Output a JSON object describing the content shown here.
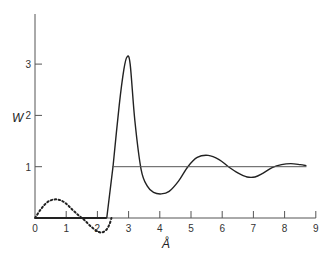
{
  "chart_data": {
    "type": "line",
    "title": "",
    "xlabel": "Å",
    "ylabel": "W",
    "xlim": [
      0,
      9
    ],
    "ylim": [
      0,
      3.8
    ],
    "grid": false,
    "legend": null,
    "x_ticks": [
      "0",
      "1",
      "2",
      "3",
      "4",
      "5",
      "6",
      "7",
      "8",
      "9"
    ],
    "y_ticks": [
      "1",
      "2",
      "3"
    ],
    "series": [
      {
        "name": "W (solid curve)",
        "style": "solid",
        "x": [
          0,
          2.3,
          2.5,
          2.7,
          2.85,
          2.95,
          3.05,
          3.2,
          3.4,
          3.6,
          3.8,
          4.05,
          4.3,
          4.6,
          4.9,
          5.2,
          5.55,
          5.9,
          6.2,
          6.5,
          6.8,
          7.05,
          7.3,
          7.6,
          7.9,
          8.2,
          8.5,
          8.7
        ],
        "values": [
          0,
          0,
          1.0,
          2.2,
          2.9,
          3.14,
          3.0,
          1.9,
          0.95,
          0.62,
          0.5,
          0.47,
          0.52,
          0.72,
          1.0,
          1.18,
          1.22,
          1.14,
          1.0,
          0.88,
          0.8,
          0.8,
          0.87,
          0.98,
          1.04,
          1.06,
          1.04,
          1.02
        ]
      },
      {
        "name": "Reference level W = 1",
        "style": "solid-thin",
        "x": [
          2.5,
          8.7
        ],
        "values": [
          1,
          1
        ]
      },
      {
        "name": "Dotted curve",
        "style": "dotted",
        "x": [
          0,
          0.2,
          0.4,
          0.6,
          0.8,
          1.0,
          1.2,
          1.4,
          1.6,
          1.8,
          2.0,
          2.15,
          2.3,
          2.4,
          2.45
        ],
        "values": [
          0,
          0.18,
          0.31,
          0.36,
          0.35,
          0.28,
          0.16,
          0.05,
          -0.05,
          -0.17,
          -0.26,
          -0.28,
          -0.22,
          -0.1,
          0
        ]
      }
    ]
  }
}
